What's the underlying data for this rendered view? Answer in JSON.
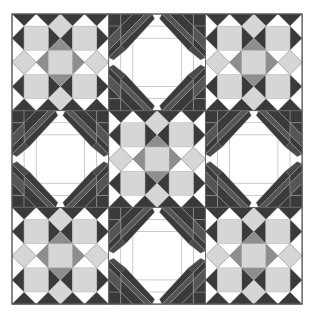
{
  "quilt": {
    "origin": [
      12,
      14
    ],
    "block_size": 96.7,
    "rows": 3,
    "cols": 3,
    "layout": [
      [
        "star",
        "paw",
        "star"
      ],
      [
        "paw",
        "star",
        "paw"
      ],
      [
        "star",
        "paw",
        "star"
      ]
    ]
  },
  "colors": {
    "background": "#ffffff",
    "dark": "#3a3a3a",
    "mid": "#8e8e8e",
    "light": "#d6d6d6",
    "lighter": "#e4e4e4",
    "line": "#a8a8a8",
    "border": "#555555"
  }
}
